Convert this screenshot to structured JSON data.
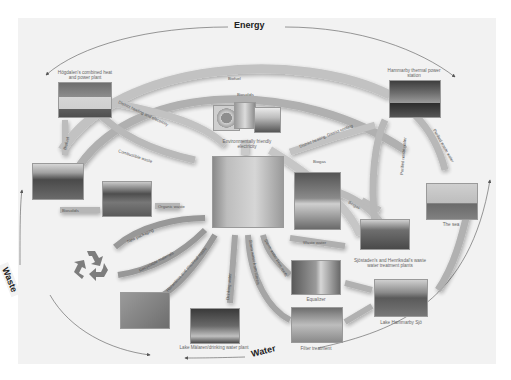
{
  "diagram": {
    "title_labels": {
      "energy": "Energy",
      "waste": "Waste",
      "water": "Water"
    },
    "nodes": [
      {
        "id": "hogdalen",
        "label": "Högdalen's combined heat and power plant"
      },
      {
        "id": "hammarby_thermal",
        "label": "Hammarby thermal power station"
      },
      {
        "id": "env_electricity",
        "label": "Environmentally friendly electricity"
      },
      {
        "id": "residence",
        "label": ""
      },
      {
        "id": "field",
        "label": ""
      },
      {
        "id": "compost",
        "label": ""
      },
      {
        "id": "recycle",
        "label": ""
      },
      {
        "id": "bins",
        "label": ""
      },
      {
        "id": "lake_malaren",
        "label": "Lake Mälaren/drinking water plant"
      },
      {
        "id": "biogas_vehicles",
        "label": ""
      },
      {
        "id": "sjostaden",
        "label": "Sjöstaden's and Henriksdal's waste water treatment plants"
      },
      {
        "id": "sea",
        "label": "The sea"
      },
      {
        "id": "equalizer",
        "label": "Equalizer"
      },
      {
        "id": "filter",
        "label": "Filter treatment"
      },
      {
        "id": "lake_hammarby",
        "label": "Lake Hammarby Sjö"
      }
    ],
    "arrows": [
      {
        "label": "Biofuel",
        "from": "hogdalen",
        "to": "hammarby_thermal"
      },
      {
        "label": "Biosolids",
        "from": "hogdalen",
        "to": "hammarby_thermal"
      },
      {
        "label": "District heating and electricity",
        "from": "hogdalen",
        "to": "residence"
      },
      {
        "label": "Combustible waste",
        "from": "residence",
        "to": "hogdalen"
      },
      {
        "label": "Biofuel",
        "from": "field",
        "to": "hogdalen"
      },
      {
        "label": "Biosolids",
        "from": "compost",
        "to": "field"
      },
      {
        "label": "Organic waste",
        "from": "residence",
        "to": "compost"
      },
      {
        "label": "District heating, District cooling",
        "from": "hammarby_thermal",
        "to": "residence"
      },
      {
        "label": "Biogas",
        "from": "sjostaden",
        "to": "residence"
      },
      {
        "label": "Biogas",
        "from": "sjostaden",
        "to": "biogas_vehicles"
      },
      {
        "label": "Purified waste water",
        "from": "sjostaden",
        "to": "hammarby_thermal"
      },
      {
        "label": "Purified waste water",
        "from": "hammarby_thermal",
        "to": "sea"
      },
      {
        "label": "Waste water",
        "from": "residence",
        "to": "sjostaden"
      },
      {
        "label": "New packaging",
        "from": "recycle",
        "to": "residence"
      },
      {
        "label": "Recyclable materials",
        "from": "residence",
        "to": "recycle"
      },
      {
        "label": "Hazardous and electrical waste",
        "from": "residence",
        "to": "bins"
      },
      {
        "label": "Drinking water",
        "from": "lake_malaren",
        "to": "residence"
      },
      {
        "label": "Storm water from roofs",
        "from": "residence",
        "to": "equalizer"
      },
      {
        "label": "Storm water from streets",
        "from": "residence",
        "to": "filter"
      }
    ]
  }
}
